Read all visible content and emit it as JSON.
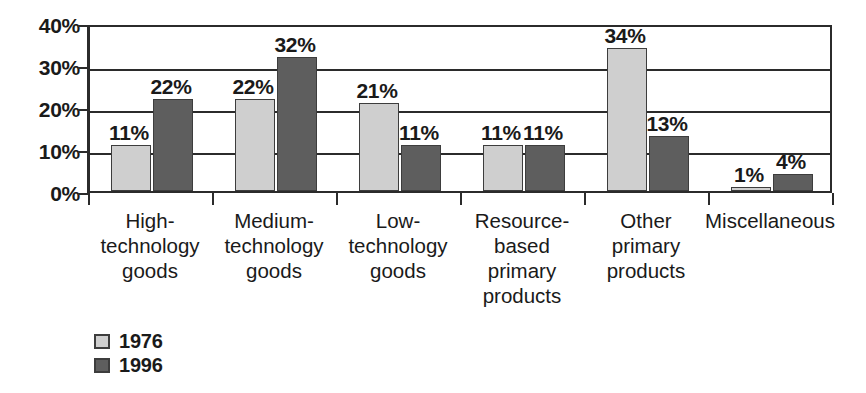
{
  "chart_data": {
    "type": "bar",
    "title": "",
    "subtitle": "",
    "xlabel": "",
    "ylabel": "",
    "ylim": [
      0,
      40
    ],
    "yticks": [
      0,
      10,
      20,
      30,
      40
    ],
    "ytick_labels": [
      "0%",
      "10%",
      "20%",
      "30%",
      "40%"
    ],
    "grid": true,
    "legend_position": "below-left",
    "value_label_suffix": "%",
    "categories": [
      "High-\ntechnology\ngoods",
      "Medium-\ntechnology\ngoods",
      "Low-\ntechnology\ngoods",
      "Resource-\nbased\nprimary\nproducts",
      "Other\nprimary\nproducts",
      "Miscellaneous"
    ],
    "series": [
      {
        "name": "1976",
        "color": "#cfcfcf",
        "values": [
          11,
          22,
          21,
          11,
          34,
          1
        ],
        "value_labels": [
          "11%",
          "22%",
          "21%",
          "11%",
          "34%",
          "1%"
        ]
      },
      {
        "name": "1996",
        "color": "#5e5e5e",
        "values": [
          22,
          32,
          11,
          11,
          13,
          4
        ],
        "value_labels": [
          "22%",
          "32%",
          "11%",
          "11%",
          "13%",
          "4%"
        ]
      }
    ]
  },
  "legend": {
    "items": [
      {
        "label": "1976",
        "color": "#cfcfcf"
      },
      {
        "label": "1996",
        "color": "#5e5e5e"
      }
    ]
  },
  "axis_colors": {
    "axis_line": "#2b2b2b",
    "gridline": "#2b2b2b",
    "bar_border": "#3d3d3d",
    "text": "#1a1a1a",
    "background": "#ffffff"
  }
}
